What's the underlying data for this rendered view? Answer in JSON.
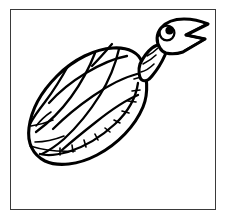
{
  "canvas": {
    "width": 226,
    "height": 221,
    "background_color": "#ffffff",
    "title": "Turtle line drawing"
  },
  "frame": {
    "name": "picture-border",
    "stroke_color": "#3a3a3a",
    "fill_color": "#ffffff",
    "left": 10,
    "top": 9,
    "width": 206,
    "height": 201
  },
  "artwork": {
    "subject": "turtle",
    "style": "black-and-white line art, coloring-book outline",
    "line_color": "#000000",
    "fill_color": "#ffffff",
    "orientation": "shell angled lower-left to upper-right, head raised toward upper right",
    "parts": [
      {
        "name": "shell",
        "label": "Carapace",
        "description": "Tilted oval dome with grid of scute cells and a segmented marginal rim along the lower-right edge"
      },
      {
        "name": "neck",
        "label": "Neck",
        "description": "Narrow band of stacked ring segments joining shell to head"
      },
      {
        "name": "head",
        "label": "Head",
        "description": "Rounded head with open pointed beak and a circular eye with filled pupil"
      },
      {
        "name": "eye",
        "label": "Eye",
        "description": "Circle outline with solid black pupil set high and to the right"
      },
      {
        "name": "beak",
        "label": "Open beak",
        "description": "Wide open V-shaped mouth with a sharp inner notch"
      }
    ]
  }
}
